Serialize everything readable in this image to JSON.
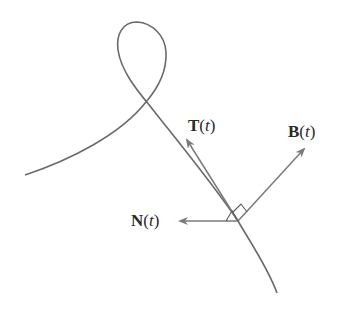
{
  "diagram": {
    "title": "",
    "colors": {
      "curve": "#6a6a6a",
      "vector": "#7a7a7a",
      "marker": "#5a5a5a",
      "text": "#2a2a2a",
      "background": "#ffffff"
    },
    "curve": {
      "name": "space curve",
      "description": "Curve with a loop at top, passing through point where TNB frame is drawn"
    },
    "origin_point": {
      "x": 238,
      "y": 221
    },
    "vectors": [
      {
        "id": "T",
        "symbol": "T",
        "open": "(",
        "var": "t",
        "close": ")",
        "tip": {
          "x": 186,
          "y": 139
        }
      },
      {
        "id": "B",
        "symbol": "B",
        "open": "(",
        "var": "t",
        "close": ")",
        "tip": {
          "x": 305,
          "y": 148
        }
      },
      {
        "id": "N",
        "symbol": "N",
        "open": "(",
        "var": "t",
        "close": ")",
        "tip": {
          "x": 179,
          "y": 221
        }
      }
    ],
    "right_angle_markers": 2
  }
}
